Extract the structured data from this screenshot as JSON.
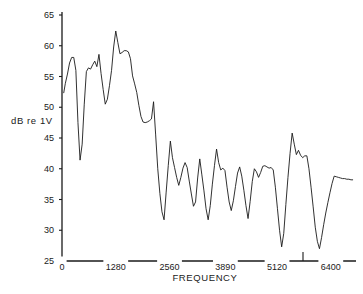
{
  "chart_data": {
    "type": "line",
    "title": "",
    "xlabel": "FREQUENCY",
    "ylabel": "dB re 1V",
    "xlim": [
      0,
      7000
    ],
    "ylim": [
      25,
      65
    ],
    "grid": false,
    "legend": null,
    "x_ticks": [
      {
        "value": 0,
        "label": "0"
      },
      {
        "value": 1280,
        "label": "1280"
      },
      {
        "value": 2560,
        "label": "2560"
      },
      {
        "value": 3890,
        "label": "3890"
      },
      {
        "value": 5120,
        "label": "5120"
      },
      {
        "value": 6400,
        "label": "6400"
      }
    ],
    "y_ticks": [
      {
        "value": 65,
        "label": "65"
      },
      {
        "value": 60,
        "label": "60"
      },
      {
        "value": 55,
        "label": "55"
      },
      {
        "value": 50,
        "label": "50"
      },
      {
        "value": 45,
        "label": "45"
      },
      {
        "value": 40,
        "label": "40"
      },
      {
        "value": 35,
        "label": "35"
      },
      {
        "value": 30,
        "label": "30"
      },
      {
        "value": 25,
        "label": "25"
      }
    ],
    "series": [
      {
        "name": "spectrum",
        "color": "#1a1a1a",
        "x": [
          40,
          80,
          130,
          180,
          230,
          280,
          330,
          380,
          430,
          480,
          530,
          580,
          630,
          680,
          730,
          780,
          830,
          880,
          930,
          980,
          1030,
          1080,
          1130,
          1180,
          1230,
          1280,
          1330,
          1380,
          1430,
          1480,
          1530,
          1580,
          1630,
          1680,
          1730,
          1780,
          1830,
          1880,
          1930,
          1980,
          2030,
          2080,
          2130,
          2180,
          2230,
          2280,
          2330,
          2380,
          2430,
          2480,
          2530,
          2580,
          2630,
          2680,
          2730,
          2780,
          2830,
          2880,
          2930,
          2980,
          3030,
          3080,
          3130,
          3180,
          3230,
          3280,
          3330,
          3380,
          3430,
          3480,
          3530,
          3580,
          3630,
          3680,
          3730,
          3780,
          3830,
          3880,
          3930,
          3980,
          4030,
          4080,
          4130,
          4180,
          4230,
          4280,
          4330,
          4380,
          4430,
          4480,
          4530,
          4580,
          4630,
          4680,
          4730,
          4780,
          4830,
          4880,
          4930,
          4980,
          5030,
          5080,
          5130,
          5180,
          5230,
          5280,
          5330,
          5380,
          5430,
          5480,
          5530,
          5580,
          5630,
          5680,
          5730,
          5780,
          5830,
          5880,
          5930,
          5980,
          6030,
          6080,
          6130,
          6180,
          6230,
          6280,
          6330,
          6380,
          6430,
          6480,
          6530,
          6580,
          6630,
          6680,
          6730,
          6780,
          6830,
          6880,
          6930
        ],
        "values": [
          52.3,
          53.9,
          55.4,
          57.2,
          58.1,
          58.1,
          56.0,
          47.5,
          41.4,
          44.0,
          50.5,
          55.8,
          56.4,
          56.2,
          56.9,
          57.5,
          56.6,
          58.6,
          55.5,
          52.9,
          50.5,
          51.3,
          53.5,
          56.0,
          59.8,
          62.4,
          60.5,
          58.7,
          58.9,
          59.2,
          59.2,
          59.0,
          57.9,
          55.1,
          53.8,
          52.4,
          50.3,
          48.5,
          47.6,
          47.5,
          47.6,
          47.8,
          48.1,
          50.9,
          45.5,
          40.0,
          36.0,
          33.0,
          31.7,
          36.2,
          40.5,
          44.5,
          41.8,
          40.2,
          38.6,
          37.3,
          38.6,
          40.1,
          41.0,
          40.2,
          38.0,
          35.9,
          33.9,
          34.6,
          38.5,
          41.6,
          39.0,
          36.4,
          33.5,
          31.7,
          34.0,
          37.5,
          40.5,
          43.2,
          41.0,
          39.8,
          40.1,
          39.7,
          37.0,
          34.6,
          33.2,
          34.8,
          37.1,
          39.3,
          40.3,
          38.8,
          36.5,
          34.0,
          31.9,
          34.7,
          37.9,
          40.0,
          39.5,
          38.6,
          39.4,
          40.4,
          40.5,
          40.3,
          40.1,
          40.2,
          39.8,
          37.0,
          33.5,
          30.0,
          27.3,
          29.5,
          34.2,
          38.6,
          42.5,
          45.8,
          44.0,
          42.3,
          43.0,
          42.2,
          41.8,
          42.1,
          42.1,
          40.0,
          37.0,
          33.8,
          30.5,
          28.2,
          27.0,
          28.8,
          30.9,
          32.8,
          34.5,
          36.1,
          37.6,
          38.8,
          38.7,
          38.6,
          38.5,
          38.4,
          38.4,
          38.3,
          38.3,
          38.2,
          38.2
        ]
      }
    ]
  },
  "axis": {
    "x_title": "FREQUENCY",
    "y_title": "dB re 1V"
  }
}
